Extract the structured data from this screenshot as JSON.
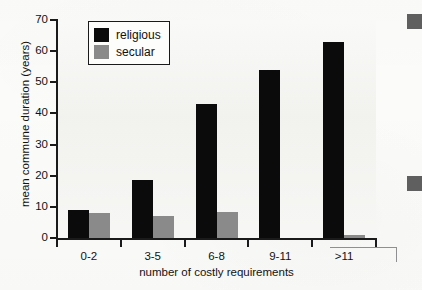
{
  "chart_data": {
    "type": "bar",
    "title": "",
    "xlabel": "number of costly requirements",
    "ylabel": "mean commune duration (years)",
    "categories": [
      "0-2",
      "3-5",
      "6-8",
      "9-11",
      ">11"
    ],
    "series": [
      {
        "name": "religious",
        "color": "#0b0b0b",
        "values": [
          9,
          18.5,
          43,
          54,
          63
        ]
      },
      {
        "name": "secular",
        "color": "#8a8a8a",
        "values": [
          8,
          7,
          8.5,
          0,
          1
        ]
      }
    ],
    "ylim": [
      0,
      70
    ],
    "ytick_labels": [
      "0",
      "10",
      "20",
      "30",
      "40",
      "50",
      "60",
      "70"
    ],
    "ytick_values": [
      0,
      10,
      20,
      30,
      40,
      50,
      60,
      70
    ],
    "grid": false,
    "legend_position": "top-left",
    "legend_entries": [
      "religious",
      "secular"
    ]
  },
  "legend": {
    "religious_label": "religious",
    "secular_label": "secular"
  },
  "axes": {
    "x_title": "number of costly requirements",
    "y_title": "mean commune duration (years)"
  }
}
